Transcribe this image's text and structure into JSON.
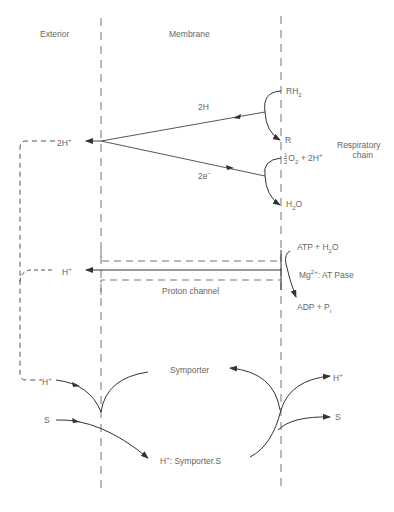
{
  "regions": {
    "exterior": "Exterior",
    "membrane": "Membrane"
  },
  "respiratory": {
    "label_line1": "Respiratory",
    "label_line2": "chain",
    "rh2": "RH",
    "rh2_sub": "2",
    "r": "R",
    "o2_frac_num": "1",
    "o2_frac_den": "2",
    "o2_text": "O",
    "o2_sub": "2",
    "o2_rest": " + 2H",
    "o2_sup": "+",
    "h2o": "H",
    "h2o_sub": "2",
    "h2o_rest": "O",
    "arrow_2h": "2H",
    "arrow_2e": "2e",
    "arrow_2e_sup": "−",
    "proton_out": "2H",
    "proton_out_sup": "+"
  },
  "atpase": {
    "atp": "ATP + H",
    "atp_sub": "2",
    "atp_rest": "O",
    "mg": "Mg",
    "mg_sup": "2+",
    "mg_rest": ": AT Pase",
    "adp": "ADP + P",
    "adp_sub": "i",
    "channel": "Proton channel",
    "proton_out": "H",
    "proton_out_sup": "+"
  },
  "symporter": {
    "h_in": "H",
    "h_in_sup": "+",
    "s_in": "S",
    "h_out": "H",
    "h_out_sup": "+",
    "s_out": "S",
    "top": "Symporter",
    "bottom_h": "H",
    "bottom_h_sup": "+",
    "bottom_rest": ": Symporter.S"
  }
}
